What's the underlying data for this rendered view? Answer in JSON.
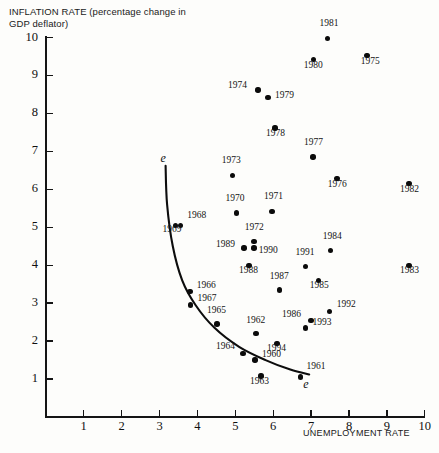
{
  "chart_data": {
    "type": "scatter",
    "title": "",
    "ylabel": "INFLATION RATE (percentage change in GDP deflator)",
    "xlabel": "UNEMPLOYMENT RATE",
    "xlim": [
      0,
      10
    ],
    "ylim": [
      0,
      10
    ],
    "xticks": [
      1,
      2,
      3,
      4,
      5,
      6,
      7,
      8,
      9,
      10
    ],
    "yticks": [
      1,
      2,
      3,
      4,
      5,
      6,
      7,
      8,
      9,
      10
    ],
    "grid": false,
    "legend": null,
    "annotations": [
      {
        "text": "e",
        "x": 3.13,
        "y": 6.8,
        "style": "italic",
        "note": "upper end of fitted Phillips curve"
      },
      {
        "text": "e",
        "x": 6.9,
        "y": 0.85,
        "style": "italic",
        "note": "lower end of fitted Phillips curve"
      }
    ],
    "curve": {
      "name": "expectations-augmented Phillips curve",
      "points": [
        [
          3.16,
          6.62
        ],
        [
          3.2,
          5.6
        ],
        [
          3.35,
          4.5
        ],
        [
          3.6,
          3.6
        ],
        [
          3.95,
          2.95
        ],
        [
          4.45,
          2.35
        ],
        [
          5.1,
          1.85
        ],
        [
          5.8,
          1.5
        ],
        [
          6.45,
          1.25
        ],
        [
          6.95,
          1.12
        ]
      ]
    },
    "points": [
      {
        "label": "1981",
        "x": 7.43,
        "y": 9.98
      },
      {
        "label": "1980",
        "x": 7.07,
        "y": 9.42
      },
      {
        "label": "1975",
        "x": 8.47,
        "y": 9.52
      },
      {
        "label": "1974",
        "x": 5.6,
        "y": 8.62
      },
      {
        "label": "1979",
        "x": 5.86,
        "y": 8.42
      },
      {
        "label": "1978",
        "x": 6.05,
        "y": 7.62
      },
      {
        "label": "1977",
        "x": 7.05,
        "y": 6.85
      },
      {
        "label": "1973",
        "x": 4.93,
        "y": 6.37
      },
      {
        "label": "1976",
        "x": 7.68,
        "y": 6.28
      },
      {
        "label": "1982",
        "x": 9.58,
        "y": 6.15
      },
      {
        "label": "1971",
        "x": 5.97,
        "y": 5.42
      },
      {
        "label": "1970",
        "x": 5.03,
        "y": 5.38
      },
      {
        "label": "1968",
        "x": 3.55,
        "y": 5.05
      },
      {
        "label": "1969",
        "x": 3.42,
        "y": 5.05
      },
      {
        "label": "1984",
        "x": 7.52,
        "y": 4.38
      },
      {
        "label": "1972",
        "x": 5.49,
        "y": 4.62
      },
      {
        "label": "1990",
        "x": 5.49,
        "y": 4.45
      },
      {
        "label": "1989",
        "x": 5.23,
        "y": 4.45
      },
      {
        "label": "1983",
        "x": 9.58,
        "y": 4.0
      },
      {
        "label": "1988",
        "x": 5.36,
        "y": 4.0
      },
      {
        "label": "1991",
        "x": 6.85,
        "y": 3.96
      },
      {
        "label": "1985",
        "x": 7.2,
        "y": 3.6
      },
      {
        "label": "1987",
        "x": 6.17,
        "y": 3.35
      },
      {
        "label": "1966",
        "x": 3.8,
        "y": 3.3
      },
      {
        "label": "1967",
        "x": 3.82,
        "y": 2.95
      },
      {
        "label": "1992",
        "x": 7.49,
        "y": 2.78
      },
      {
        "label": "1986",
        "x": 7.0,
        "y": 2.55
      },
      {
        "label": "1965",
        "x": 4.52,
        "y": 2.45
      },
      {
        "label": "1993",
        "x": 6.85,
        "y": 2.35
      },
      {
        "label": "1962",
        "x": 5.55,
        "y": 2.2
      },
      {
        "label": "1994",
        "x": 6.1,
        "y": 1.93
      },
      {
        "label": "1964",
        "x": 5.2,
        "y": 1.68
      },
      {
        "label": "1960",
        "x": 5.52,
        "y": 1.5
      },
      {
        "label": "1961",
        "x": 6.72,
        "y": 1.05
      },
      {
        "label": "1963",
        "x": 5.68,
        "y": 1.08
      }
    ]
  },
  "labels": {
    "y_axis_title": "INFLATION RATE (percentage change in GDP deflator)",
    "x_axis_title": "UNEMPLOYMENT RATE"
  }
}
